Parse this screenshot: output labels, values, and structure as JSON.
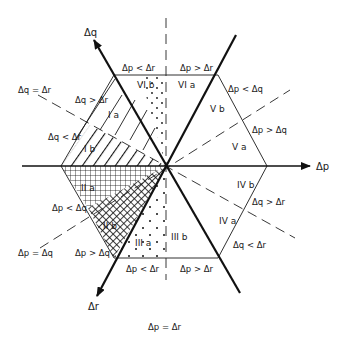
{
  "diagram": {
    "axes": {
      "dp": "Δp",
      "dq": "Δq",
      "dr": "Δr"
    },
    "dividing_lines": {
      "dq_eq_dr": "Δq = Δr",
      "dp_eq_dq": "Δp = Δq",
      "dp_eq_dr": "Δp = Δr"
    },
    "edge_labels": {
      "top_left": "Δp < Δr",
      "top_right": "Δp > Δr",
      "upper_right_top": "Δp < Δq",
      "upper_right_bottom": "Δp > Δq",
      "lower_right_top": "Δq > Δr",
      "lower_right_bottom": "Δq < Δr",
      "bottom_left": "Δp < Δr",
      "bottom_right": "Δp > Δr",
      "lower_left_top": "Δp < Δq",
      "lower_left_bottom": "Δp > Δq",
      "upper_left_top": "Δq > Δr",
      "upper_left_bottom": "Δq < Δr"
    },
    "regions": {
      "Ia": "I a",
      "Ib": "I b",
      "IIa": "II a",
      "IIb": "II b",
      "IIIa": "III a",
      "IIIb": "III b",
      "IVa": "IV a",
      "IVb": "IV b",
      "Va": "V a",
      "Vb": "V b",
      "VIa": "VI a",
      "VIb": "VI b"
    }
  }
}
